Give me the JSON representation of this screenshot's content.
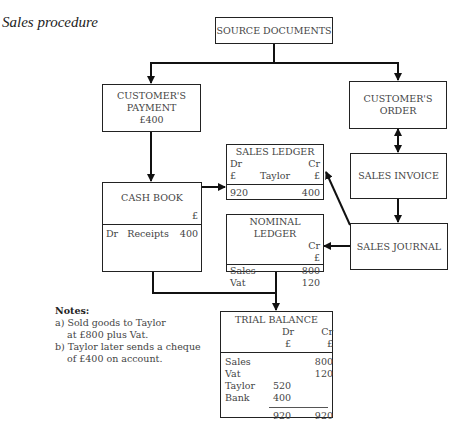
{
  "title": "Sales procedure",
  "source_documents": {
    "label": "SOURCE DOCUMENTS"
  },
  "customers_payment": {
    "line1": "CUSTOMER'S",
    "line2": "PAYMENT",
    "amount": "£400"
  },
  "customers_order": {
    "line1": "CUSTOMER'S",
    "line2": "ORDER"
  },
  "sales_ledger": {
    "title": "SALES LEDGER",
    "dr": "Dr",
    "cr": "Cr",
    "pound_dr": "£",
    "account": "Taylor",
    "pound_cr": "£",
    "debit": "920",
    "credit": "400"
  },
  "cash_book": {
    "title": "CASH BOOK",
    "pound": "£",
    "dr": "Dr",
    "label": "Receipts",
    "amount": "400"
  },
  "sales_invoice": {
    "label": "SALES INVOICE"
  },
  "nominal_ledger": {
    "title": "NOMINAL LEDGER",
    "cr": "Cr",
    "pound": "£",
    "rows": [
      {
        "label": "Sales",
        "value": "800"
      },
      {
        "label": "Vat",
        "value": "120"
      }
    ]
  },
  "sales_journal": {
    "label": "SALES JOURNAL"
  },
  "trial_balance": {
    "title": "TRIAL BALANCE",
    "dr": "Dr",
    "cr": "Cr",
    "pound_dr": "£",
    "pound_cr": "£",
    "rows": [
      {
        "label": "Sales",
        "dr": "",
        "cr": "800"
      },
      {
        "label": "Vat",
        "dr": "",
        "cr": "120"
      },
      {
        "label": "Taylor",
        "dr": "520",
        "cr": ""
      },
      {
        "label": "Bank",
        "dr": "400",
        "cr": ""
      }
    ],
    "total_dr": "920",
    "total_cr": "920"
  },
  "notes": {
    "heading": "Notes:",
    "a1": "a) Sold goods to Taylor",
    "a2": "at £800 plus Vat.",
    "b1": "b) Taylor later sends a cheque",
    "b2": "of £400 on account."
  }
}
